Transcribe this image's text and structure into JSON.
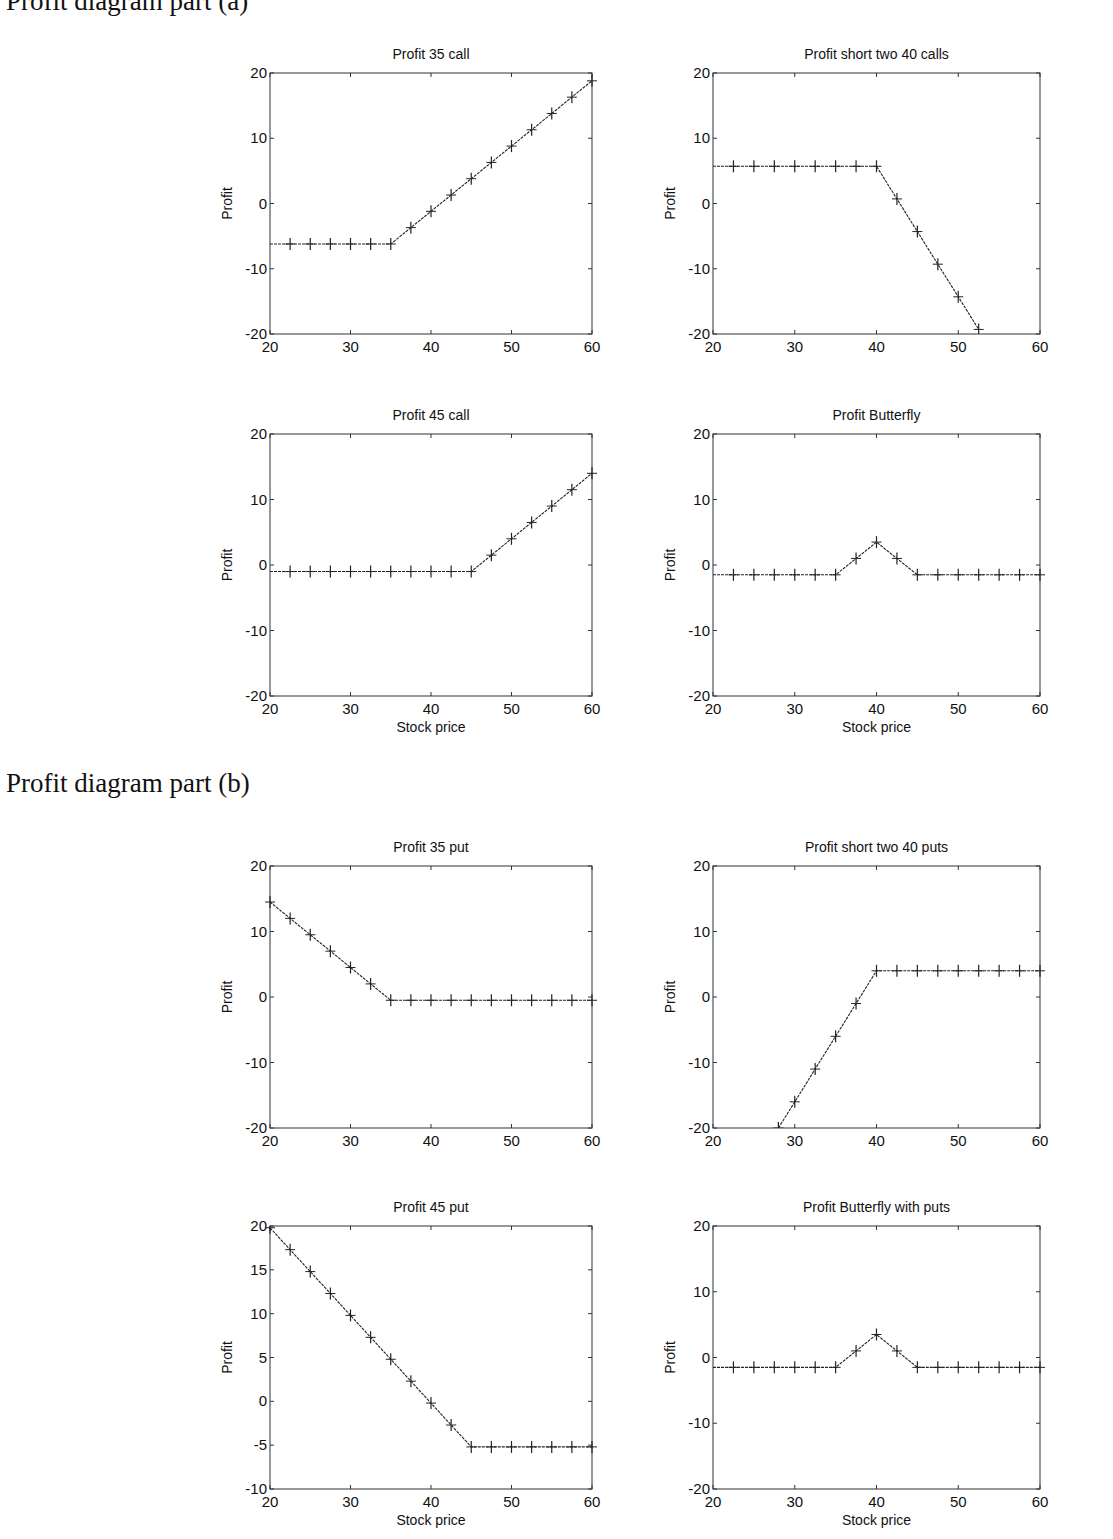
{
  "sections": {
    "a": {
      "title": "Profit diagram part (a)"
    },
    "b": {
      "title": "Profit diagram part (b)"
    }
  },
  "style": {
    "line_color": "#222222",
    "axis_color": "#333333",
    "background": "#ffffff"
  },
  "chart_data": [
    {
      "id": "profit-35-call",
      "section": "a",
      "type": "line",
      "title": "Profit 35 call",
      "xlabel": "",
      "ylabel": "Profit",
      "xlim": [
        20,
        60
      ],
      "ylim": [
        -20,
        20
      ],
      "xticks": [
        20,
        30,
        40,
        50,
        60
      ],
      "yticks": [
        -20,
        -10,
        0,
        10,
        20
      ],
      "grid": false,
      "marker": "+",
      "x": [
        20,
        22.5,
        25,
        27.5,
        30,
        32.5,
        35,
        37.5,
        40,
        42.5,
        45,
        47.5,
        50,
        52.5,
        55,
        57.5,
        60
      ],
      "y": [
        -6.2,
        -6.2,
        -6.2,
        -6.2,
        -6.2,
        -6.2,
        -6.2,
        -3.7,
        -1.2,
        1.3,
        3.8,
        6.3,
        8.8,
        11.3,
        13.8,
        16.3,
        18.8
      ]
    },
    {
      "id": "profit-short-two-40-calls",
      "section": "a",
      "type": "line",
      "title": "Profit short two 40 calls",
      "xlabel": "",
      "ylabel": "Profit",
      "xlim": [
        20,
        60
      ],
      "ylim": [
        -20,
        20
      ],
      "xticks": [
        20,
        30,
        40,
        50,
        60
      ],
      "yticks": [
        -20,
        -10,
        0,
        10,
        20
      ],
      "grid": false,
      "marker": "+",
      "x": [
        20,
        22.5,
        25,
        27.5,
        30,
        32.5,
        35,
        37.5,
        40,
        42.5,
        45,
        47.5,
        50,
        52.5
      ],
      "y": [
        5.7,
        5.7,
        5.7,
        5.7,
        5.7,
        5.7,
        5.7,
        5.7,
        5.7,
        0.7,
        -4.3,
        -9.3,
        -14.3,
        -19.3
      ]
    },
    {
      "id": "profit-45-call",
      "section": "a",
      "type": "line",
      "title": "Profit 45 call",
      "xlabel": "Stock price",
      "ylabel": "Profit",
      "xlim": [
        20,
        60
      ],
      "ylim": [
        -20,
        20
      ],
      "xticks": [
        20,
        30,
        40,
        50,
        60
      ],
      "yticks": [
        -20,
        -10,
        0,
        10,
        20
      ],
      "grid": false,
      "marker": "+",
      "x": [
        20,
        22.5,
        25,
        27.5,
        30,
        32.5,
        35,
        37.5,
        40,
        42.5,
        45,
        47.5,
        50,
        52.5,
        55,
        57.5,
        60
      ],
      "y": [
        -1.0,
        -1.0,
        -1.0,
        -1.0,
        -1.0,
        -1.0,
        -1.0,
        -1.0,
        -1.0,
        -1.0,
        -1.0,
        1.5,
        4.0,
        6.5,
        9.0,
        11.5,
        14.0
      ]
    },
    {
      "id": "profit-butterfly",
      "section": "a",
      "type": "line",
      "title": "Profit Butterfly",
      "xlabel": "Stock price",
      "ylabel": "Profit",
      "xlim": [
        20,
        60
      ],
      "ylim": [
        -20,
        20
      ],
      "xticks": [
        20,
        30,
        40,
        50,
        60
      ],
      "yticks": [
        -20,
        -10,
        0,
        10,
        20
      ],
      "grid": false,
      "marker": "+",
      "x": [
        20,
        22.5,
        25,
        27.5,
        30,
        32.5,
        35,
        37.5,
        40,
        42.5,
        45,
        47.5,
        50,
        52.5,
        55,
        57.5,
        60
      ],
      "y": [
        -1.5,
        -1.5,
        -1.5,
        -1.5,
        -1.5,
        -1.5,
        -1.5,
        1.0,
        3.5,
        1.0,
        -1.5,
        -1.5,
        -1.5,
        -1.5,
        -1.5,
        -1.5,
        -1.5
      ]
    },
    {
      "id": "profit-35-put",
      "section": "b",
      "type": "line",
      "title": "Profit 35 put",
      "xlabel": "",
      "ylabel": "Profit",
      "xlim": [
        20,
        60
      ],
      "ylim": [
        -20,
        20
      ],
      "xticks": [
        20,
        30,
        40,
        50,
        60
      ],
      "yticks": [
        -20,
        -10,
        0,
        10,
        20
      ],
      "grid": false,
      "marker": "+",
      "x": [
        20,
        22.5,
        25,
        27.5,
        30,
        32.5,
        35,
        37.5,
        40,
        42.5,
        45,
        47.5,
        50,
        52.5,
        55,
        57.5,
        60
      ],
      "y": [
        14.5,
        12.0,
        9.5,
        7.0,
        4.5,
        2.0,
        -0.5,
        -0.5,
        -0.5,
        -0.5,
        -0.5,
        -0.5,
        -0.5,
        -0.5,
        -0.5,
        -0.5,
        -0.5
      ]
    },
    {
      "id": "profit-short-two-40-puts",
      "section": "b",
      "type": "line",
      "title": "Profit short two 40 puts",
      "xlabel": "",
      "ylabel": "Profit",
      "xlim": [
        20,
        60
      ],
      "ylim": [
        -20,
        20
      ],
      "xticks": [
        20,
        30,
        40,
        50,
        60
      ],
      "yticks": [
        -20,
        -10,
        0,
        10,
        20
      ],
      "grid": false,
      "marker": "+",
      "x": [
        28,
        30,
        32.5,
        35,
        37.5,
        40,
        42.5,
        45,
        47.5,
        50,
        52.5,
        55,
        57.5,
        60
      ],
      "y": [
        -20,
        -16.0,
        -11.0,
        -6.0,
        -1.0,
        4.0,
        4.0,
        4.0,
        4.0,
        4.0,
        4.0,
        4.0,
        4.0,
        4.0
      ]
    },
    {
      "id": "profit-45-put",
      "section": "b",
      "type": "line",
      "title": "Profit 45 put",
      "xlabel": "Stock price",
      "ylabel": "Profit",
      "xlim": [
        20,
        60
      ],
      "ylim": [
        -10,
        20
      ],
      "xticks": [
        20,
        30,
        40,
        50,
        60
      ],
      "yticks": [
        -10,
        -5,
        0,
        5,
        10,
        15,
        20
      ],
      "grid": false,
      "marker": "+",
      "x": [
        20,
        22.5,
        25,
        27.5,
        30,
        32.5,
        35,
        37.5,
        40,
        42.5,
        45,
        47.5,
        50,
        52.5,
        55,
        57.5,
        60
      ],
      "y": [
        19.8,
        17.3,
        14.8,
        12.3,
        9.8,
        7.3,
        4.8,
        2.3,
        -0.2,
        -2.7,
        -5.2,
        -5.2,
        -5.2,
        -5.2,
        -5.2,
        -5.2,
        -5.2
      ]
    },
    {
      "id": "profit-butterfly-with-puts",
      "section": "b",
      "type": "line",
      "title": "Profit Butterfly with puts",
      "xlabel": "Stock price",
      "ylabel": "Profit",
      "xlim": [
        20,
        60
      ],
      "ylim": [
        -20,
        20
      ],
      "xticks": [
        20,
        30,
        40,
        50,
        60
      ],
      "yticks": [
        -20,
        -10,
        0,
        10,
        20
      ],
      "grid": false,
      "marker": "+",
      "x": [
        20,
        22.5,
        25,
        27.5,
        30,
        32.5,
        35,
        37.5,
        40,
        42.5,
        45,
        47.5,
        50,
        52.5,
        55,
        57.5,
        60
      ],
      "y": [
        -1.5,
        -1.5,
        -1.5,
        -1.5,
        -1.5,
        -1.5,
        -1.5,
        1.0,
        3.5,
        1.0,
        -1.5,
        -1.5,
        -1.5,
        -1.5,
        -1.5,
        -1.5,
        -1.5
      ]
    }
  ]
}
